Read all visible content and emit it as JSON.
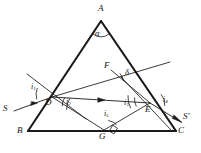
{
  "figure": {
    "stroke_color": "#1a1a1a",
    "background": "#ffffff",
    "triangle": {
      "vertices": [
        {
          "name": "A",
          "label": "A",
          "x": 101,
          "y": 21
        },
        {
          "name": "B",
          "label": "B",
          "x": 28,
          "y": 131
        },
        {
          "name": "C",
          "label": "C",
          "x": 176,
          "y": 131
        }
      ],
      "apex_angle_label": "α"
    },
    "points": [
      {
        "name": "D",
        "label": "D",
        "x": 52,
        "y": 97
      },
      {
        "name": "E",
        "label": "E",
        "x": 150,
        "y": 103
      },
      {
        "name": "F",
        "label": "F",
        "x": 111,
        "y": 70
      },
      {
        "name": "G",
        "label": "G",
        "x": 104,
        "y": 131
      }
    ],
    "rays": [
      {
        "name": "incident-ray",
        "label": "S",
        "from": {
          "x": 14,
          "y": 110
        },
        "to": {
          "x": 52,
          "y": 97
        },
        "arrow": true
      },
      {
        "name": "emergent-ray",
        "label": "S'",
        "from": {
          "x": 150,
          "y": 103
        },
        "to": {
          "x": 182,
          "y": 122
        },
        "arrow": true
      },
      {
        "name": "internal-ray",
        "label": "",
        "from": {
          "x": 52,
          "y": 97
        },
        "to": {
          "x": 150,
          "y": 103
        },
        "arrow": true
      }
    ],
    "angles": [
      {
        "name": "alpha",
        "label": "α",
        "at": "A",
        "lx": 97,
        "ly": 33
      },
      {
        "name": "i1",
        "label": "i",
        "sub": "1",
        "at": "D",
        "lx": 33,
        "ly": 88
      },
      {
        "name": "i2",
        "label": "i",
        "sub": "2",
        "at": "D",
        "lx": 68,
        "ly": 103
      },
      {
        "name": "i3",
        "label": "i",
        "sub": "3",
        "at": "E",
        "lx": 127,
        "ly": 103
      },
      {
        "name": "i4",
        "label": "i",
        "sub": "4",
        "at": "E",
        "lx": 163,
        "ly": 100
      },
      {
        "name": "i5",
        "label": "i",
        "sub": "5",
        "at": "G",
        "lx": 108,
        "ly": 117
      },
      {
        "name": "delta",
        "label": "δ",
        "at": "F",
        "lx": 126,
        "ly": 74
      }
    ],
    "markers": [
      {
        "name": "right-angle-marker",
        "at": "G",
        "type": "square"
      }
    ]
  }
}
